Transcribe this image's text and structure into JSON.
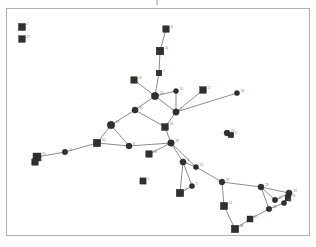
{
  "figure": {
    "type": "node-link-network-diagram",
    "title": "",
    "caption": "",
    "background_color": "#ffffff",
    "frame_color": "#b0b0b0",
    "node_color": "#303030",
    "edge_color": "#5a5a5a",
    "label_color": "#787878",
    "node_shapes": [
      "square",
      "circle"
    ],
    "top_tick_mark": ""
  },
  "chart_data": {
    "type": "scatter",
    "title": "",
    "xlabel": "",
    "ylabel": "",
    "grid": false,
    "legend": "none",
    "xlim": [
      0,
      304
    ],
    "ylim": [
      0,
      228
    ],
    "nodes": [
      {
        "id": "n2",
        "label": "2",
        "shape": "square",
        "x": 15,
        "y": 18,
        "size": 7.0
      },
      {
        "id": "n27",
        "label": "27",
        "shape": "square",
        "x": 15,
        "y": 30,
        "size": 6.6
      },
      {
        "id": "n11",
        "label": "11",
        "shape": "square",
        "x": 159,
        "y": 20,
        "size": 6.4
      },
      {
        "id": "n16",
        "label": "16",
        "shape": "square",
        "x": 153,
        "y": 42,
        "size": 7.6
      },
      {
        "id": "n7",
        "label": "7",
        "shape": "square",
        "x": 152,
        "y": 64,
        "size": 5.6
      },
      {
        "id": "n13",
        "label": "13",
        "shape": "square",
        "x": 127,
        "y": 71,
        "size": 6.4
      },
      {
        "id": "n24",
        "label": "24",
        "shape": "circle",
        "x": 148,
        "y": 87,
        "size": 7.4
      },
      {
        "id": "n10",
        "label": "10",
        "shape": "circle",
        "x": 169,
        "y": 82,
        "size": 5.0
      },
      {
        "id": "n17",
        "label": "17",
        "shape": "square",
        "x": 196,
        "y": 81,
        "size": 6.6
      },
      {
        "id": "n34",
        "label": "34",
        "shape": "circle",
        "x": 230,
        "y": 84,
        "size": 5.2
      },
      {
        "id": "n6",
        "label": "6",
        "shape": "circle",
        "x": 169,
        "y": 103,
        "size": 6.4
      },
      {
        "id": "n20",
        "label": "20",
        "shape": "circle",
        "x": 128,
        "y": 101,
        "size": 6.2
      },
      {
        "id": "n29",
        "label": "29",
        "shape": "circle",
        "x": 104,
        "y": 116,
        "size": 7.6
      },
      {
        "id": "n26",
        "label": "26",
        "shape": "square",
        "x": 158,
        "y": 118,
        "size": 6.8
      },
      {
        "id": "n33",
        "label": "33",
        "shape": "circle",
        "x": 164,
        "y": 134,
        "size": 6.6
      },
      {
        "id": "n8",
        "label": "8",
        "shape": "circle",
        "x": 122,
        "y": 137,
        "size": 6.0
      },
      {
        "id": "n40",
        "label": "40",
        "shape": "square",
        "x": 90,
        "y": 134,
        "size": 7.4
      },
      {
        "id": "n23",
        "label": "23",
        "shape": "square",
        "x": 142,
        "y": 145,
        "size": 6.4
      },
      {
        "id": "n14",
        "label": "14",
        "shape": "circle",
        "x": 58,
        "y": 143,
        "size": 5.6
      },
      {
        "id": "n15",
        "label": "15",
        "shape": "square",
        "x": 30,
        "y": 148,
        "size": 8.0
      },
      {
        "id": "n31",
        "label": "31",
        "shape": "square",
        "x": 28,
        "y": 153,
        "size": 6.4
      },
      {
        "id": "n25",
        "label": "25",
        "shape": "circle",
        "x": 220,
        "y": 124,
        "size": 6.0
      },
      {
        "id": "n4",
        "label": "4",
        "shape": "square",
        "x": 224,
        "y": 126,
        "size": 5.4
      },
      {
        "id": "n5",
        "label": "5",
        "shape": "square",
        "x": 136,
        "y": 172,
        "size": 6.2
      },
      {
        "id": "n1",
        "label": "1",
        "shape": "circle",
        "x": 176,
        "y": 153,
        "size": 6.2
      },
      {
        "id": "n41",
        "label": "41",
        "shape": "circle",
        "x": 189,
        "y": 158,
        "size": 5.2
      },
      {
        "id": "n3",
        "label": "3",
        "shape": "circle",
        "x": 185,
        "y": 177,
        "size": 5.2
      },
      {
        "id": "n9",
        "label": "9",
        "shape": "square",
        "x": 173,
        "y": 184,
        "size": 7.4
      },
      {
        "id": "n37",
        "label": "37",
        "shape": "circle",
        "x": 215,
        "y": 173,
        "size": 5.8
      },
      {
        "id": "n12",
        "label": "12",
        "shape": "square",
        "x": 217,
        "y": 197,
        "size": 7.2
      },
      {
        "id": "n28",
        "label": "28",
        "shape": "circle",
        "x": 254,
        "y": 178,
        "size": 6.0
      },
      {
        "id": "n22",
        "label": "22",
        "shape": "circle",
        "x": 268,
        "y": 191,
        "size": 5.4
      },
      {
        "id": "n19",
        "label": "19",
        "shape": "circle",
        "x": 282,
        "y": 184,
        "size": 6.2
      },
      {
        "id": "n30",
        "label": "30",
        "shape": "square",
        "x": 281,
        "y": 189,
        "size": 5.8
      },
      {
        "id": "n36",
        "label": "36",
        "shape": "circle",
        "x": 277,
        "y": 194,
        "size": 5.2
      },
      {
        "id": "n18",
        "label": "18",
        "shape": "circle",
        "x": 262,
        "y": 200,
        "size": 5.6
      },
      {
        "id": "n21",
        "label": "21",
        "shape": "square",
        "x": 243,
        "y": 210,
        "size": 6.0
      },
      {
        "id": "n38",
        "label": "38",
        "shape": "square",
        "x": 228,
        "y": 220,
        "size": 7.4
      }
    ],
    "edges": [
      {
        "source": "n11",
        "target": "n16"
      },
      {
        "source": "n16",
        "target": "n7"
      },
      {
        "source": "n7",
        "target": "n24"
      },
      {
        "source": "n13",
        "target": "n24"
      },
      {
        "source": "n24",
        "target": "n10"
      },
      {
        "source": "n24",
        "target": "n20"
      },
      {
        "source": "n24",
        "target": "n6"
      },
      {
        "source": "n10",
        "target": "n6"
      },
      {
        "source": "n17",
        "target": "n6"
      },
      {
        "source": "n34",
        "target": "n6"
      },
      {
        "source": "n6",
        "target": "n26"
      },
      {
        "source": "n20",
        "target": "n29"
      },
      {
        "source": "n20",
        "target": "n26"
      },
      {
        "source": "n26",
        "target": "n33"
      },
      {
        "source": "n29",
        "target": "n40"
      },
      {
        "source": "n29",
        "target": "n8"
      },
      {
        "source": "n40",
        "target": "n8"
      },
      {
        "source": "n8",
        "target": "n33"
      },
      {
        "source": "n33",
        "target": "n23"
      },
      {
        "source": "n40",
        "target": "n14"
      },
      {
        "source": "n14",
        "target": "n15"
      },
      {
        "source": "n15",
        "target": "n31"
      },
      {
        "source": "n33",
        "target": "n1"
      },
      {
        "source": "n33",
        "target": "n41"
      },
      {
        "source": "n1",
        "target": "n41"
      },
      {
        "source": "n1",
        "target": "n3"
      },
      {
        "source": "n1",
        "target": "n9"
      },
      {
        "source": "n3",
        "target": "n9"
      },
      {
        "source": "n41",
        "target": "n37"
      },
      {
        "source": "n37",
        "target": "n12"
      },
      {
        "source": "n37",
        "target": "n28"
      },
      {
        "source": "n12",
        "target": "n38"
      },
      {
        "source": "n38",
        "target": "n21"
      },
      {
        "source": "n21",
        "target": "n18"
      },
      {
        "source": "n28",
        "target": "n22"
      },
      {
        "source": "n28",
        "target": "n19"
      },
      {
        "source": "n28",
        "target": "n18"
      },
      {
        "source": "n22",
        "target": "n19"
      },
      {
        "source": "n19",
        "target": "n30"
      },
      {
        "source": "n30",
        "target": "n36"
      },
      {
        "source": "n18",
        "target": "n36"
      },
      {
        "source": "n25",
        "target": "n4"
      }
    ],
    "isolated_nodes": [
      "n2",
      "n27",
      "n5"
    ]
  }
}
